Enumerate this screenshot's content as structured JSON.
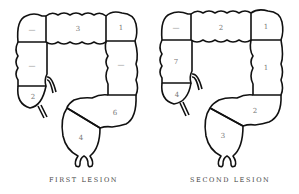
{
  "diagrams": [
    {
      "caption": "FIRST LESION",
      "segments": {
        "hepatic_flexure_left": "—",
        "transverse": "3",
        "splenic_flexure": "1",
        "ascending": "—",
        "descending": "—",
        "cecum": "2",
        "sigmoid": "6",
        "rectum": "4"
      }
    },
    {
      "caption": "SECOND LESION",
      "segments": {
        "hepatic_flexure_left": "—",
        "transverse": "2",
        "splenic_flexure": "1",
        "ascending": "7",
        "descending": "1",
        "cecum": "4",
        "sigmoid": "2",
        "rectum": "3"
      }
    }
  ]
}
